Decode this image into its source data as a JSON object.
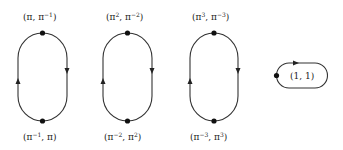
{
  "diagram": {
    "loops": [
      {
        "top_label": {
          "base1": "(π, π",
          "sup1": "−1",
          "end": ")"
        },
        "bottom_label": {
          "base1": "(π",
          "sup1": "−1",
          "mid": ", π)"
        }
      },
      {
        "top_label": {
          "base1": "(π",
          "sup1": "2",
          "mid": ", π",
          "sup2": "−2",
          "end": ")"
        },
        "bottom_label": {
          "base1": "(π",
          "sup1": "−2",
          "mid": ", π",
          "sup2": "2",
          "end": ")"
        }
      },
      {
        "top_label": {
          "base1": "(π",
          "sup1": "3",
          "mid": ", π",
          "sup2": "−3",
          "end": ")"
        },
        "bottom_label": {
          "base1": "(π",
          "sup1": "−3",
          "mid": ", π",
          "sup2": "3",
          "end": ")"
        }
      }
    ],
    "small_loop": {
      "label": "(1, 1)"
    }
  }
}
